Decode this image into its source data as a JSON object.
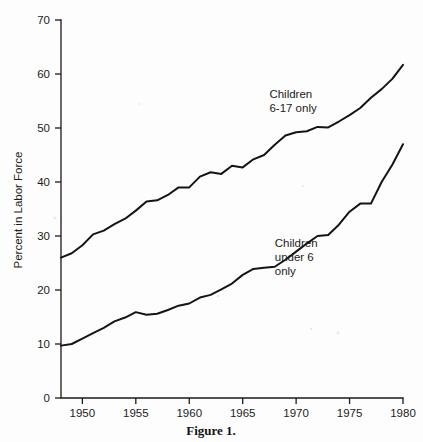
{
  "figure": {
    "caption": "Figure 1."
  },
  "chart_data": {
    "type": "line",
    "title": "",
    "xlabel": "",
    "ylabel": "Percent in Labor Force",
    "xlim": [
      1948,
      1980
    ],
    "ylim": [
      0,
      70
    ],
    "xticks": [
      1950,
      1955,
      1960,
      1965,
      1970,
      1975,
      1980
    ],
    "xtick_labels": [
      "1950",
      "1955",
      "1960",
      "1965",
      "1970",
      "1975",
      "1980"
    ],
    "yticks": [
      0,
      10,
      20,
      30,
      40,
      50,
      60,
      70
    ],
    "ytick_labels": [
      "0",
      "10",
      "20",
      "30",
      "40",
      "50",
      "60",
      "70"
    ],
    "grid": false,
    "legend_position": "inline-annotation",
    "line_color": "#141414",
    "series": [
      {
        "name": "Children 6-17 only",
        "annotation": [
          "Children",
          "6-17 only"
        ],
        "annotation_x": 1967.5,
        "annotation_y": 55.5,
        "x": [
          1948,
          1949,
          1950,
          1951,
          1952,
          1953,
          1954,
          1955,
          1956,
          1957,
          1958,
          1959,
          1960,
          1961,
          1962,
          1963,
          1964,
          1965,
          1966,
          1967,
          1968,
          1969,
          1970,
          1971,
          1972,
          1973,
          1974,
          1975,
          1976,
          1977,
          1978,
          1979,
          1980
        ],
        "values": [
          26.0,
          26.8,
          28.3,
          30.3,
          31.0,
          32.2,
          33.2,
          34.7,
          36.4,
          36.6,
          37.6,
          39.0,
          39.0,
          41.0,
          41.8,
          41.5,
          43.0,
          42.7,
          44.2,
          45.0,
          46.9,
          48.6,
          49.2,
          49.4,
          50.2,
          50.1,
          51.2,
          52.4,
          53.7,
          55.6,
          57.2,
          59.1,
          61.7
        ]
      },
      {
        "name": "Children under 6 only",
        "annotation": [
          "Children",
          "under 6",
          "only"
        ],
        "annotation_x": 1968.0,
        "annotation_y": 28.0,
        "x": [
          1948,
          1949,
          1950,
          1951,
          1952,
          1953,
          1954,
          1955,
          1956,
          1957,
          1958,
          1959,
          1960,
          1961,
          1962,
          1963,
          1964,
          1965,
          1966,
          1967,
          1968,
          1969,
          1970,
          1971,
          1972,
          1973,
          1974,
          1975,
          1976,
          1977,
          1978,
          1979,
          1980
        ],
        "values": [
          9.7,
          10.0,
          11.0,
          12.0,
          13.0,
          14.2,
          14.9,
          15.9,
          15.4,
          15.6,
          16.3,
          17.1,
          17.5,
          18.6,
          19.1,
          20.1,
          21.2,
          22.8,
          23.9,
          24.1,
          24.3,
          25.6,
          27.1,
          28.6,
          30.0,
          30.2,
          32.1,
          34.5,
          36.0,
          36.0,
          40.0,
          43.2,
          47.0
        ]
      }
    ]
  }
}
